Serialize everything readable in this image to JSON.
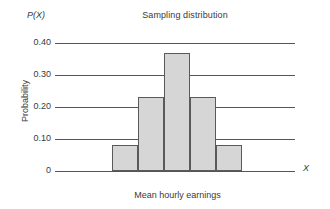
{
  "chart_data": {
    "type": "bar",
    "title": "Sampling distribution",
    "xlabel": "Mean hourly earnings",
    "ylabel": "Probability",
    "x_axis_symbol": "X",
    "y_axis_symbol": "P(X)",
    "categories": [
      "7.50",
      "7.75",
      "8.00",
      "8.25",
      "8.50"
    ],
    "values": [
      0.08,
      0.23,
      0.37,
      0.23,
      0.08
    ],
    "ylim": [
      0,
      0.4
    ],
    "xlim_categories": 5,
    "ytick_labels": [
      "0.40",
      "0.30",
      "0.20",
      "0.10",
      "0"
    ],
    "ytick_values": [
      0.4,
      0.3,
      0.2,
      0.1,
      0
    ],
    "grid": "horizontal",
    "legend": "none",
    "bar_fill_color": "#d6d6d6",
    "bar_edge_color": "#5a5a5a",
    "gridline_color": "#555555",
    "text_color": "#3a3a3a",
    "background_color": "#ffffff"
  }
}
